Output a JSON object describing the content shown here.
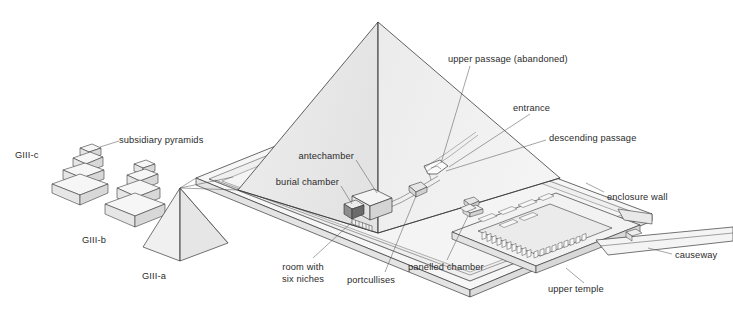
{
  "figure": {
    "background_color": "#ffffff",
    "line_color": "#3a3a3a",
    "text_color": "#2b2b2b",
    "face_fill_light": "#f2f2f2",
    "face_fill_mid": "#e8e8e8",
    "face_fill_dark": "#dcdcdc"
  },
  "labels": {
    "subsidiary_pyramids": "subsidiary pyramids",
    "giii_c": "GIII-c",
    "giii_b": "GIII-b",
    "giii_a": "GIII-a",
    "upper_passage": "upper passage (abandoned)",
    "entrance": "entrance",
    "descending_passage": "descending passage",
    "antechamber": "antechamber",
    "burial_chamber": "burial chamber",
    "room_with_six_niches_line1": "room with",
    "room_with_six_niches_line2": "six niches",
    "portcullises": "portcullises",
    "panelled_chamber": "panelled chamber",
    "enclosure_wall": "enclosure wall",
    "upper_temple": "upper temple",
    "causeway": "causeway"
  },
  "structures": {
    "main_pyramid": "main pyramid",
    "enclosure_platform": "enclosure wall platform",
    "temple_courtyard": "upper temple courtyard",
    "causeway_ramp": "causeway ramp",
    "burial_chamber_box": "burial chamber",
    "antechamber_box": "antechamber",
    "entrance_funnel": "entrance opening",
    "portcullis_blocks": "portcullis blocks",
    "six_niche_room": "room with six niches",
    "panelled_chamber_box": "panelled chamber"
  }
}
